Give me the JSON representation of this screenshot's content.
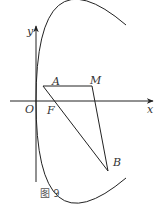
{
  "figure": {
    "caption": "图 9",
    "axes": {
      "x_label": "x",
      "y_label": "y",
      "origin_label": "O"
    },
    "points": {
      "A": {
        "label": "A"
      },
      "M": {
        "label": "M"
      },
      "F": {
        "label": "F"
      },
      "B": {
        "label": "B"
      }
    },
    "curve": "parabola opening right, vertex at O",
    "segments": [
      "AM",
      "AB",
      "MB"
    ],
    "colors": {
      "stroke": "#222222",
      "background": "#ffffff"
    }
  }
}
